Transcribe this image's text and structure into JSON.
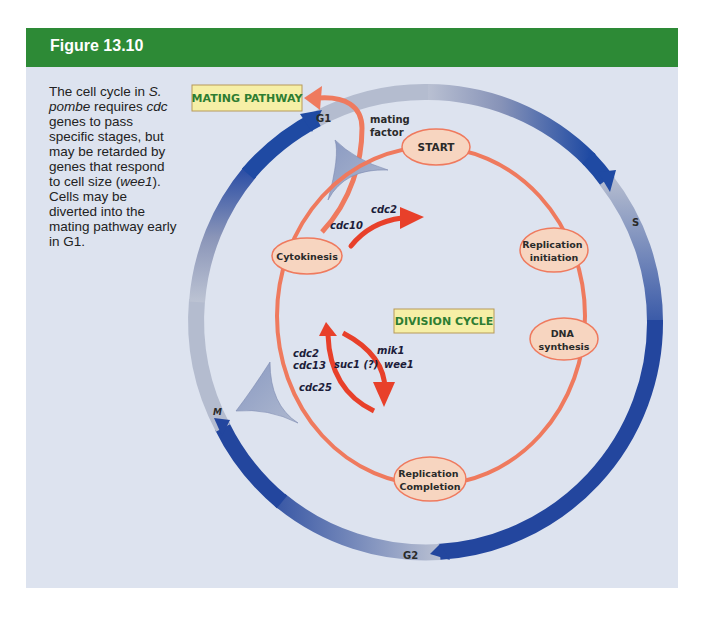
{
  "figure": {
    "title": "Figure 13.10",
    "caption": {
      "parts": [
        "The cell cycle in ",
        "S. pombe",
        " requires ",
        "cdc",
        " genes to pass specific stages, but may be retarded by genes that respond to cell size (",
        "wee1",
        ").  Cells may be diverted into the mating pathway early in G1."
      ]
    },
    "colors": {
      "header": "#2d8a36",
      "panel_bg": "#dde3ef",
      "ring_blue": "#1f4aa3",
      "ring_grey": "#a8b2c8",
      "orange_path": "#ef7a5e",
      "red_arrow": "#e8402a",
      "node_fill": "#f7d5c0",
      "label_box": "#f6efa6"
    }
  },
  "diagram": {
    "outer_phases": [
      {
        "label": "G1"
      },
      {
        "label": "S"
      },
      {
        "label": "G2"
      },
      {
        "label": "M"
      }
    ],
    "boxes": {
      "mating_pathway": "MATING PATHWAY",
      "division_cycle": "DIVISION CYCLE"
    },
    "mating_factor": [
      "mating",
      "factor"
    ],
    "nodes": [
      {
        "id": "start",
        "lines": [
          "START"
        ]
      },
      {
        "id": "cytokinesis",
        "lines": [
          "Cytokinesis"
        ]
      },
      {
        "id": "replication-initiation",
        "lines": [
          "Replication",
          "initiation"
        ]
      },
      {
        "id": "dna-synthesis",
        "lines": [
          "DNA",
          "synthesis"
        ]
      },
      {
        "id": "replication-completion",
        "lines": [
          "Replication",
          "Completion"
        ]
      }
    ],
    "genes": {
      "start_arrow": [
        "cdc2",
        "cdc10"
      ],
      "left_arrow": [
        "cdc2",
        "cdc13",
        "cdc25"
      ],
      "middle": "suc1 (?)",
      "right_arrow": [
        "mik1",
        "wee1"
      ]
    }
  }
}
